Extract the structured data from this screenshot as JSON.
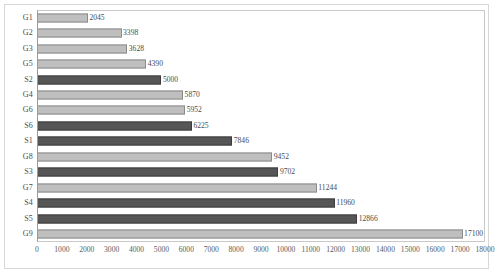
{
  "chart_data": {
    "type": "bar",
    "orientation": "horizontal",
    "title": "",
    "subtitle": "",
    "xlabel": "",
    "ylabel": "",
    "xlim": [
      0,
      18000
    ],
    "xticks": [
      0,
      1000,
      2000,
      3000,
      4000,
      5000,
      6000,
      7000,
      8000,
      9000,
      10000,
      11000,
      12000,
      13000,
      14000,
      15000,
      16000,
      17000,
      18000
    ],
    "xtick_labels": [
      "0",
      "1000",
      "2000",
      "3000",
      "4000",
      "5000",
      "6000",
      "7000",
      "8000",
      "9000",
      "10000",
      "11000",
      "12000",
      "13000",
      "14000",
      "15000",
      "16000",
      "17000",
      "18000"
    ],
    "grid": false,
    "legend": false,
    "data_labels": true,
    "categories": [
      "G1",
      "G2",
      "G3",
      "G5",
      "S2",
      "G4",
      "G6",
      "S6",
      "S1",
      "G8",
      "S3",
      "G7",
      "S4",
      "S5",
      "G9"
    ],
    "values": [
      2045,
      3398,
      3628,
      4390,
      5000,
      5870,
      5952,
      6225,
      7846,
      9452,
      9702,
      11244,
      11960,
      12866,
      17100
    ],
    "value_labels": [
      "2045",
      "3398",
      "3628",
      "4390",
      "5000",
      "5870",
      "5952",
      "6225",
      "7846",
      "9452",
      "9702",
      "11244",
      "11960",
      "12866",
      "17100"
    ],
    "bar_styles": [
      "light",
      "light",
      "light",
      "light",
      "dark",
      "light",
      "light",
      "dark",
      "dark",
      "light",
      "dark",
      "light",
      "dark",
      "dark",
      "light"
    ],
    "colors": {
      "light_bar_fill": "#bfbfbf",
      "light_bar_border": "#8a8a8a",
      "dark_bar_fill": "#565656",
      "dark_bar_border": "#3d3d3d",
      "axis": "#9a9a9a",
      "frame": "#d8d8d8",
      "text": "#4a4a4a",
      "background": "#ffffff"
    },
    "rows": [
      {
        "category": "G1",
        "value": 2045,
        "label": "2045",
        "style": "light"
      },
      {
        "category": "G2",
        "value": 3398,
        "label": "3398",
        "style": "light"
      },
      {
        "category": "G3",
        "value": 3628,
        "label": "3628",
        "style": "light"
      },
      {
        "category": "G5",
        "value": 4390,
        "label": "4390",
        "style": "light"
      },
      {
        "category": "S2",
        "value": 5000,
        "label": "5000",
        "style": "dark"
      },
      {
        "category": "G4",
        "value": 5870,
        "label": "5870",
        "style": "light"
      },
      {
        "category": "G6",
        "value": 5952,
        "label": "5952",
        "style": "light"
      },
      {
        "category": "S6",
        "value": 6225,
        "label": "6225",
        "style": "dark"
      },
      {
        "category": "S1",
        "value": 7846,
        "label": "7846",
        "style": "dark"
      },
      {
        "category": "G8",
        "value": 9452,
        "label": "9452",
        "style": "light"
      },
      {
        "category": "S3",
        "value": 9702,
        "label": "9702",
        "style": "dark"
      },
      {
        "category": "G7",
        "value": 11244,
        "label": "11244",
        "style": "light"
      },
      {
        "category": "S4",
        "value": 11960,
        "label": "11960",
        "style": "dark"
      },
      {
        "category": "S5",
        "value": 12866,
        "label": "12866",
        "style": "dark"
      },
      {
        "category": "G9",
        "value": 17100,
        "label": "17100",
        "style": "light"
      }
    ]
  }
}
